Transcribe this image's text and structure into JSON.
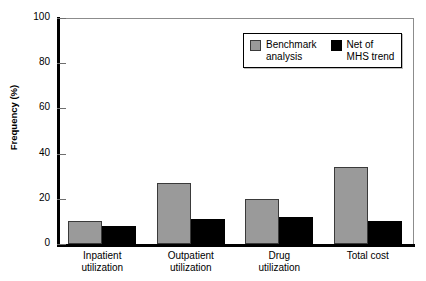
{
  "chart_data": {
    "type": "bar",
    "title": "",
    "xlabel": "",
    "ylabel": "Frequency (%)",
    "ylim": [
      0,
      100
    ],
    "yticks": [
      0,
      20,
      40,
      60,
      80,
      100
    ],
    "ytick_labels": [
      "0",
      "20",
      "40",
      "60",
      "80",
      "100"
    ],
    "grid": false,
    "legend_position": "upper right",
    "categories": [
      "Inpatient utilization",
      "Outpatient utilization",
      "Drug utilization",
      "Total cost"
    ],
    "category_lines": [
      [
        "Inpatient",
        "utilization"
      ],
      [
        "Outpatient",
        "utilization"
      ],
      [
        "Drug",
        "utilization"
      ],
      [
        "Total cost",
        ""
      ]
    ],
    "series": [
      {
        "name": "Benchmark analysis",
        "name_lines": [
          "Benchmark",
          "analysis"
        ],
        "color": "#9a9a9a",
        "values": [
          10,
          27,
          20,
          34
        ]
      },
      {
        "name": "Net of MHS trend",
        "name_lines": [
          "Net of",
          "MHS trend"
        ],
        "color": "#000000",
        "values": [
          8,
          11,
          12,
          10
        ]
      }
    ]
  }
}
